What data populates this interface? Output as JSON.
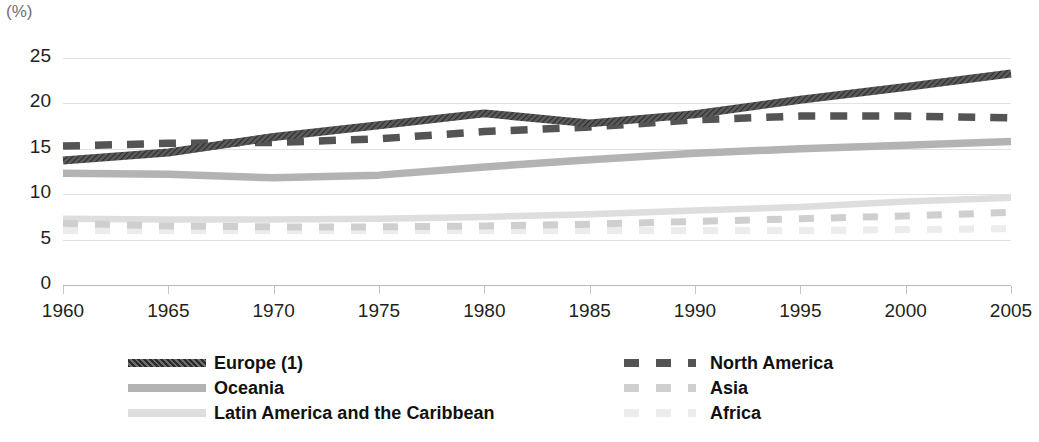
{
  "axis": {
    "unit_label": "(%)",
    "y_ticks": [
      0,
      5,
      10,
      15,
      20,
      25
    ],
    "x_ticks": [
      1960,
      1965,
      1970,
      1975,
      1980,
      1985,
      1990,
      1995,
      2000,
      2005
    ]
  },
  "legend": {
    "left": [
      {
        "label": "Europe (1)",
        "key": "europe"
      },
      {
        "label": "Oceania",
        "key": "oceania"
      },
      {
        "label": "Latin America and the Caribbean",
        "key": "latin_america"
      }
    ],
    "right": [
      {
        "label": "North America",
        "key": "north_america"
      },
      {
        "label": "Asia",
        "key": "asia"
      },
      {
        "label": "Africa",
        "key": "africa"
      }
    ]
  },
  "colors": {
    "europe": "#4d4d4d",
    "north_america": "#545454",
    "oceania": "#b3b3b3",
    "asia": "#cfcfcf",
    "latin_america": "#dedede",
    "africa": "#ececec",
    "gridline": "#e2e2e2",
    "axis": "#b9b9b9",
    "text": "#231f20"
  },
  "chart_data": {
    "type": "line",
    "title": "",
    "subtitle": "",
    "xlabel": "",
    "ylabel": "(%)",
    "xlim": [
      1960,
      2005
    ],
    "ylim": [
      0,
      25
    ],
    "grid": true,
    "legend_position": "bottom",
    "x": [
      1960,
      1965,
      1970,
      1975,
      1980,
      1985,
      1990,
      1995,
      2000,
      2005
    ],
    "series": [
      {
        "name": "Europe (1)",
        "key": "europe",
        "style": "solid-hatched",
        "color": "#4d4d4d",
        "values": [
          13.7,
          14.6,
          16.3,
          17.6,
          18.9,
          17.8,
          18.8,
          20.4,
          21.8,
          23.3
        ]
      },
      {
        "name": "North America",
        "key": "north_america",
        "style": "dashed",
        "color": "#545454",
        "values": [
          15.3,
          15.6,
          15.7,
          16.1,
          16.9,
          17.4,
          18.2,
          18.6,
          18.6,
          18.4
        ]
      },
      {
        "name": "Oceania",
        "key": "oceania",
        "style": "solid",
        "color": "#b3b3b3",
        "values": [
          12.3,
          12.2,
          11.8,
          12.1,
          13.0,
          13.8,
          14.5,
          15.0,
          15.4,
          15.8
        ]
      },
      {
        "name": "Asia",
        "key": "asia",
        "style": "dashed",
        "color": "#cfcfcf",
        "values": [
          6.8,
          6.5,
          6.4,
          6.4,
          6.5,
          6.7,
          7.0,
          7.3,
          7.6,
          8.0
        ]
      },
      {
        "name": "Latin America and the Caribbean",
        "key": "latin_america",
        "style": "solid",
        "color": "#dedede",
        "values": [
          7.3,
          7.2,
          7.2,
          7.3,
          7.5,
          7.8,
          8.2,
          8.6,
          9.2,
          9.6
        ]
      },
      {
        "name": "Africa",
        "key": "africa",
        "style": "dashed",
        "color": "#ececec",
        "values": [
          6.0,
          6.0,
          6.0,
          6.0,
          6.0,
          6.0,
          6.0,
          6.0,
          6.1,
          6.2
        ]
      }
    ]
  }
}
